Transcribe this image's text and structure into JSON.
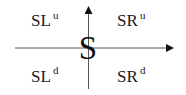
{
  "diagram": {
    "center_label": "S",
    "quadrants": {
      "top_left": {
        "base": "SL",
        "sup": "u"
      },
      "top_right": {
        "base": "SR",
        "sup": "u"
      },
      "bottom_left": {
        "base": "SL",
        "sup": "d"
      },
      "bottom_right": {
        "base": "SR",
        "sup": "d"
      }
    },
    "axes": {
      "vertical": {
        "direction": "up",
        "arrow": true
      },
      "horizontal": {
        "direction": "right",
        "arrow": true
      }
    },
    "colors": {
      "line": "#555555",
      "text": "#1a1a1a",
      "background": "#ffffff"
    }
  }
}
